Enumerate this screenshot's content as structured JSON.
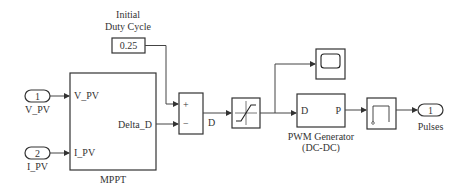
{
  "constant": {
    "title_line1": "Initial",
    "title_line2": "Duty Cycle",
    "value": "0.25"
  },
  "inport1": {
    "number": "1",
    "label": "V_PV"
  },
  "inport2": {
    "number": "2",
    "label": "I_PV"
  },
  "mppt": {
    "name": "MPPT",
    "in1": "V_PV",
    "in2": "I_PV",
    "out": "Delta_D"
  },
  "sum": {
    "plus": "+",
    "minus": "−",
    "out_label": "D"
  },
  "pwm": {
    "name_line1": "PWM Generator",
    "name_line2": "(DC-DC)",
    "in": "D",
    "out": "P"
  },
  "outport": {
    "number": "1",
    "label": "Pulses"
  }
}
